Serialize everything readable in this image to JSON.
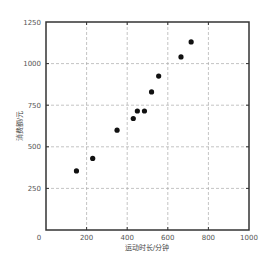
{
  "chart_data": {
    "type": "scatter",
    "title": "",
    "xlabel": "运动时长/分钟",
    "ylabel": "消费额/元",
    "xlim": [
      0,
      1000
    ],
    "ylim": [
      0,
      1250
    ],
    "xticks": [
      0,
      200,
      400,
      600,
      800,
      1000
    ],
    "yticks": [
      250,
      500,
      750,
      1000,
      1250
    ],
    "grid": true,
    "legend": null,
    "series": [
      {
        "name": "points",
        "color": "#111111",
        "points": [
          {
            "x": 150,
            "y": 355
          },
          {
            "x": 230,
            "y": 430
          },
          {
            "x": 350,
            "y": 600
          },
          {
            "x": 430,
            "y": 670
          },
          {
            "x": 450,
            "y": 715
          },
          {
            "x": 485,
            "y": 715
          },
          {
            "x": 520,
            "y": 830
          },
          {
            "x": 555,
            "y": 925
          },
          {
            "x": 665,
            "y": 1040
          },
          {
            "x": 715,
            "y": 1130
          }
        ]
      }
    ]
  },
  "style": {
    "frame_color": "#333333",
    "grid_color": "#aaaaaa",
    "point_color": "#111111"
  }
}
